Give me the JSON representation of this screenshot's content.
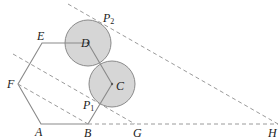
{
  "diagram": {
    "colors": {
      "hexagon_stroke": "#8a8a8a",
      "dashed_stroke": "#9a9a9a",
      "circle_fill": "#d6d6d6",
      "circle_stroke": "#8a8a8a",
      "label": "#222222"
    },
    "labels": {
      "A": "A",
      "B": "B",
      "C": "C",
      "D": "D",
      "E": "E",
      "F": "F",
      "G": "G",
      "H": "H",
      "P1": "P",
      "P1_sub": "1",
      "P2": "P",
      "P2_sub": "2"
    },
    "points": {
      "A": [
        41,
        124
      ],
      "B": [
        88,
        124
      ],
      "C": [
        112,
        84
      ],
      "D": [
        88,
        43
      ],
      "E": [
        42,
        43
      ],
      "F": [
        18,
        84
      ],
      "G": [
        135,
        124
      ],
      "H": [
        278,
        124
      ],
      "P1": [
        97,
        105
      ],
      "P2": [
        101,
        21
      ]
    },
    "circles": [
      {
        "name": "circle-D",
        "center": "D",
        "r": 23
      },
      {
        "name": "circle-C",
        "center": "C",
        "r": 23
      }
    ],
    "dashed_lines": [
      {
        "name": "line-F-B",
        "from": "F",
        "to": "B"
      },
      {
        "name": "line-through-G",
        "from": [
          13,
          54
        ],
        "to": "G"
      },
      {
        "name": "line-P2-H",
        "from": [
          68,
          4
        ],
        "to": "H"
      },
      {
        "name": "line-B-H",
        "from": "B",
        "to": "H"
      }
    ]
  }
}
